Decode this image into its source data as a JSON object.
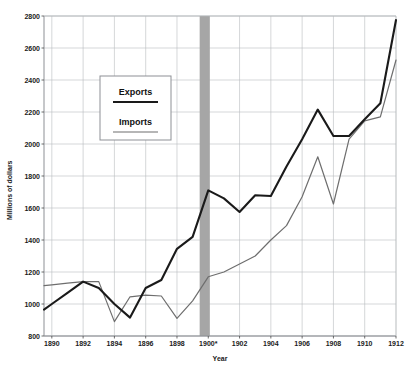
{
  "chart_data": {
    "type": "line",
    "title": "",
    "xlabel": "Year",
    "ylabel": "Millions of dollars",
    "xlim": [
      1889.5,
      1912
    ],
    "ylim": [
      800,
      2800
    ],
    "grid": true,
    "legend_position": "upper-left-inset",
    "x_ticks": [
      "1890",
      "1892",
      "1894",
      "1896",
      "1898",
      "1900*",
      "1902",
      "1904",
      "1906",
      "1908",
      "1910",
      "1912"
    ],
    "x_tick_values": [
      1890,
      1892,
      1894,
      1896,
      1898,
      1900,
      1902,
      1904,
      1906,
      1908,
      1910,
      1912
    ],
    "y_ticks": [
      "800",
      "1000",
      "1200",
      "1400",
      "1600",
      "1800",
      "2000",
      "2200",
      "2400",
      "2600",
      "2800"
    ],
    "y_tick_values": [
      800,
      1000,
      1200,
      1400,
      1600,
      1800,
      2000,
      2200,
      2400,
      2600,
      2800
    ],
    "annotation_band": {
      "label": "1900*",
      "x_start": 1899.45,
      "x_end": 1900.1,
      "color": "#a6a6a6"
    },
    "x": [
      1889.5,
      1890,
      1891,
      1892,
      1893,
      1894,
      1895,
      1896,
      1897,
      1898,
      1899,
      1900,
      1901,
      1902,
      1903,
      1904,
      1905,
      1906,
      1907,
      1908,
      1909,
      1910,
      1911,
      1912
    ],
    "series": [
      {
        "name": "Exports",
        "color": "#1a1a1a",
        "width": 2.1,
        "values": [
          965,
          1000,
          1070,
          1140,
          1100,
          1000,
          915,
          1100,
          1150,
          1345,
          1420,
          1710,
          1660,
          1575,
          1680,
          1675,
          1860,
          2030,
          2215,
          2050,
          2050,
          2155,
          2255,
          2775
        ]
      },
      {
        "name": "Imports",
        "color": "#6e6e6e",
        "width": 1.2,
        "values": [
          1115,
          1120,
          1130,
          1140,
          1140,
          890,
          1045,
          1055,
          1050,
          910,
          1020,
          1170,
          1200,
          1250,
          1300,
          1400,
          1490,
          1670,
          1920,
          1625,
          2030,
          2145,
          2170,
          2525
        ]
      }
    ]
  },
  "legend": {
    "entries": [
      {
        "label": "Exports",
        "color": "#1a1a1a",
        "width": 2.1
      },
      {
        "label": "Imports",
        "color": "#6e6e6e",
        "width": 1.2
      }
    ]
  },
  "axes": {
    "y_title": "Millions of dollars",
    "x_title": "Year"
  }
}
